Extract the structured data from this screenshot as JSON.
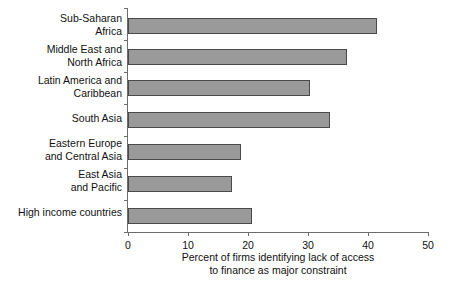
{
  "chart_data": {
    "type": "bar",
    "orientation": "horizontal",
    "title": "",
    "subtitle": "",
    "xlabel": "Percent of firms identifying lack of access to finance as major constraint",
    "ylabel": "",
    "xlim": [
      0,
      50
    ],
    "xticks": [
      0,
      10,
      20,
      30,
      40,
      50
    ],
    "xtick_labels": [
      "0",
      "10",
      "20",
      "30",
      "40",
      "50"
    ],
    "grid": false,
    "legend": null,
    "categories": [
      "Sub-Saharan Africa",
      "Middle East and North Africa",
      "Latin America and Caribbean",
      "South Asia",
      "Eastern Europe and Central Asia",
      "East Asia and Pacific",
      "High income countries"
    ],
    "category_label_lines": [
      [
        "Sub-Saharan",
        "Africa"
      ],
      [
        "Middle East and",
        "North Africa"
      ],
      [
        "Latin America and",
        "Caribbean"
      ],
      [
        "South Asia"
      ],
      [
        "Eastern Europe",
        "and Central Asia"
      ],
      [
        "East Asia",
        "and Pacific"
      ],
      [
        "High income countries"
      ]
    ],
    "values": [
      41.5,
      36.5,
      30.3,
      33.7,
      18.8,
      17.3,
      20.7
    ],
    "bar_color": "#9a9a9a",
    "bar_border_color": "#4a4a4a",
    "axis_color": "#6d6d6d",
    "background_color": "#ffffff"
  },
  "caption": {
    "line1": "Percent of firms identifying lack of access",
    "line2": "to finance as major constraint"
  }
}
